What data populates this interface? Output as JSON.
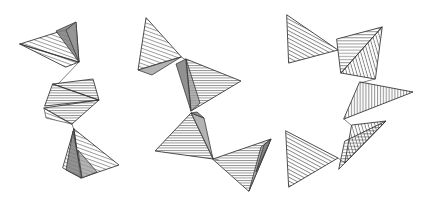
{
  "canvas": {
    "width": 425,
    "height": 203,
    "background": "#ffffff",
    "description": "Three abstract hand-drawn zigzag figures built from hatched triangles"
  },
  "style": {
    "line_color": "#3a3a3a",
    "hatch_color": "#2e2e2e",
    "shade_dark": "#7e7e7e",
    "shade_mid": "#9a9a9a"
  },
  "figures": [
    {
      "id": "figure-left",
      "label": "Z-shaped zigzag chain",
      "bbox": [
        18,
        20,
        118,
        178
      ],
      "triangles": [
        {
          "name": "top-wing",
          "points": "22,44 75,28 78,61",
          "hatch": "diagonal-down",
          "shade": "light"
        },
        {
          "name": "top-wing-lower",
          "points": "22,44 78,61 68,66",
          "hatch": "diagonal-down",
          "shade": "light"
        },
        {
          "name": "top-crest",
          "points": "58,30 75,22 78,61",
          "hatch": "none",
          "shade": "dark"
        },
        {
          "name": "mid-upper-band",
          "points": "50,85 92,80 98,99",
          "hatch": "horizontal",
          "shade": "light"
        },
        {
          "name": "mid-lower-band",
          "points": "44,110 98,99 70,122",
          "hatch": "horizontal",
          "shade": "light"
        },
        {
          "name": "bottom-wing",
          "points": "73,128 118,164 80,177",
          "hatch": "diagonal-down",
          "shade": "light"
        },
        {
          "name": "bottom-spike",
          "points": "73,128 80,177 66,168",
          "hatch": "none",
          "shade": "dark"
        }
      ]
    },
    {
      "id": "figure-middle",
      "label": "S-shaped zigzag chain",
      "bbox": [
        138,
        18,
        275,
        190
      ],
      "triangles": [
        {
          "name": "top-left-wing",
          "points": "146,18 139,70 180,58",
          "hatch": "diagonal-down",
          "shade": "light"
        },
        {
          "name": "top-left-base",
          "points": "139,70 180,58 152,74",
          "hatch": "none",
          "shade": "mid"
        },
        {
          "name": "upper-right-wing",
          "points": "186,60 240,80 190,110",
          "hatch": "horizontal",
          "shade": "light"
        },
        {
          "name": "upper-right-under",
          "points": "186,60 190,110 196,106",
          "hatch": "none",
          "shade": "mid"
        },
        {
          "name": "lower-left-wing",
          "points": "190,112 156,150 212,158",
          "hatch": "horizontal",
          "shade": "light"
        },
        {
          "name": "lower-left-spike",
          "points": "190,112 212,158 203,120",
          "hatch": "none",
          "shade": "mid"
        },
        {
          "name": "bottom-right-wing",
          "points": "212,158 270,140 248,190",
          "hatch": "horizontal",
          "shade": "light"
        },
        {
          "name": "bottom-right-spike",
          "points": "262,146 270,140 248,190",
          "hatch": "none",
          "shade": "mid"
        }
      ]
    },
    {
      "id": "figure-right",
      "label": "Three-pointed zigzag chain",
      "bbox": [
        283,
        14,
        412,
        186
      ],
      "triangles": [
        {
          "name": "top-left-wing",
          "points": "287,16 337,50 288,62",
          "hatch": "diagonal-down",
          "shade": "none"
        },
        {
          "name": "top-right-band",
          "points": "337,40 381,28 340,72",
          "hatch": "horizontal",
          "shade": "none"
        },
        {
          "name": "top-right-fold",
          "points": "381,28 340,72 374,78",
          "hatch": "diagonal-steep",
          "shade": "none"
        },
        {
          "name": "mid-right-wing",
          "points": "360,82 412,92 344,118",
          "hatch": "vertical",
          "shade": "none"
        },
        {
          "name": "lower-right-band",
          "points": "352,126 385,122 344,162",
          "hatch": "diagonal-steep",
          "shade": "none"
        },
        {
          "name": "lower-right-fold",
          "points": "344,140 385,122 340,168",
          "hatch": "horizontal",
          "shade": "none"
        },
        {
          "name": "bottom-left-wing",
          "points": "286,132 337,158 288,186",
          "hatch": "diagonal-down",
          "shade": "none"
        }
      ]
    }
  ]
}
